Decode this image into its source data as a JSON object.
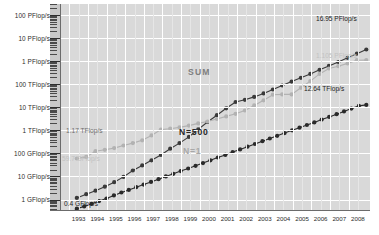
{
  "chart_data": {
    "type": "line",
    "title": "",
    "subtitle": "",
    "xlabel": "",
    "ylabel": "",
    "log_scale_y": true,
    "grid": true,
    "legend_position": "inline-annotations",
    "x": [
      1993,
      1994,
      1995,
      1996,
      1997,
      1998,
      1999,
      2000,
      2001,
      2002,
      2003,
      2004,
      2005,
      2006,
      2007,
      2008
    ],
    "x_tick_labels": [
      "1993",
      "1994",
      "1995",
      "1996",
      "1997",
      "1998",
      "1999",
      "2000",
      "2001",
      "2002",
      "2003",
      "2004",
      "2005",
      "2006",
      "2007",
      "2008"
    ],
    "y_tick_labels": [
      "100 PFlop/s",
      "10 PFlop/s",
      "1 PFlop/s",
      "100 TFlop/s",
      "10 TFlop/s",
      "1 TFlop/s",
      "100 GFlop/s",
      "10 GFlop/s",
      "1 GFlop/s"
    ],
    "y_tick_values_gflops": [
      100000000,
      10000000,
      1000000,
      100000,
      10000,
      1000,
      100,
      10,
      1
    ],
    "ylim_gflops": [
      0.4,
      300000000
    ],
    "series": [
      {
        "name": "SUM",
        "color": "#3a3a3a",
        "points_gflops": [
          1.17,
          1.7,
          2.4,
          3.6,
          5.6,
          9.5,
          18,
          30,
          50,
          85,
          160,
          280,
          520,
          1100,
          2300,
          4500,
          9000,
          16900,
          21000,
          28000,
          40000,
          59000,
          88000,
          130000,
          190000,
          280000,
          420000,
          620000,
          920000,
          1400000,
          2100000,
          3200000
        ]
      },
      {
        "name": "N=1",
        "color": "#b2b2b2",
        "points_gflops": [
          59.7,
          70,
          124,
          143,
          170,
          220,
          280,
          370,
          600,
          1070,
          1170,
          1340,
          1600,
          2000,
          2400,
          3100,
          4000,
          5200,
          7200,
          12000,
          20000,
          35000,
          36000,
          36000,
          70000,
          136000,
          280000,
          480000,
          600000,
          800000,
          1100000,
          1105000
        ]
      },
      {
        "name": "N=500",
        "color": "#2a2a2a",
        "points_gflops": [
          0.4,
          0.5,
          0.65,
          0.85,
          1.1,
          1.5,
          2.0,
          2.6,
          3.4,
          4.4,
          5.8,
          7.6,
          10,
          13,
          17,
          22,
          29,
          38,
          50,
          66,
          86,
          113,
          148,
          195,
          256,
          336,
          440,
          578,
          760,
          1000,
          1300,
          1700,
          2200,
          2900,
          3800,
          5000,
          6600,
          8700,
          11400,
          12640
        ]
      }
    ],
    "annotations": [
      {
        "name": "sum-label",
        "text": "SUM",
        "style": "sum"
      },
      {
        "name": "n1-label",
        "text": "N=1",
        "style": "n1"
      },
      {
        "name": "n500-label",
        "text": "N=500",
        "style": "n500"
      },
      {
        "name": "sum-start",
        "text": "1.17 TFlop/s",
        "style": "val-mid"
      },
      {
        "name": "sum-end",
        "text": "16.95 PFlop/s",
        "style": "val-dark"
      },
      {
        "name": "n1-start",
        "text": "59.7 GFlop/s",
        "style": "val-light"
      },
      {
        "name": "n1-end",
        "text": "1.105 PFlop/s",
        "style": "val-light"
      },
      {
        "name": "n500-start",
        "text": "0.4 GFlop/s",
        "style": "val-dark"
      },
      {
        "name": "n500-end",
        "text": "12.64 TFlop/s",
        "style": "val-dark"
      }
    ],
    "colors": {
      "plot_background": "#d9d9d9",
      "gridline": "#ffffff",
      "axis": "#6b6b6b",
      "sum_series": "#3a3a3a",
      "n1_series": "#b2b2b2",
      "n500_series": "#2a2a2a",
      "page_background": "#ffffff"
    }
  }
}
